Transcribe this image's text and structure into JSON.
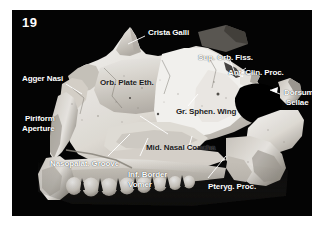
{
  "figure": {
    "number": "19",
    "caption_style": "anatomical photograph plate",
    "background_color": "#ffffff",
    "plate_color": "#050505",
    "label_color": "#ffffff",
    "dark_label_color": "#1a1a1a"
  },
  "labels": [
    {
      "id": "crista-galli",
      "text": "Crista Galli",
      "tone": "light"
    },
    {
      "id": "sup-orb-fiss",
      "text": "Sup. Orb. Fiss.",
      "tone": "light"
    },
    {
      "id": "ant-clin-proc",
      "text": "Ant. Clin. Proc.",
      "tone": "light"
    },
    {
      "id": "dorsum-sellae-1",
      "text": "Dorsum",
      "tone": "light"
    },
    {
      "id": "dorsum-sellae-2",
      "text": "Sellae",
      "tone": "light"
    },
    {
      "id": "agger-nasi",
      "text": "Agger Nasi",
      "tone": "light"
    },
    {
      "id": "orb-plate-eth",
      "text": "Orb. Plate Eth.",
      "tone": "dark"
    },
    {
      "id": "piriform-1",
      "text": "Piriform",
      "tone": "light"
    },
    {
      "id": "piriform-2",
      "text": "Aperture",
      "tone": "light"
    },
    {
      "id": "gr-sphen-wing",
      "text": "Gr. Sphen. Wing",
      "tone": "dark"
    },
    {
      "id": "mid-nasal-concha",
      "text": "Mid. Nasal Concha",
      "tone": "dark"
    },
    {
      "id": "nasopalat-groove",
      "text": "Nasopalat. Groove",
      "tone": "light"
    },
    {
      "id": "inf-border",
      "text": "Inf. Border",
      "tone": "light"
    },
    {
      "id": "vomer",
      "text": "Vomer",
      "tone": "light"
    },
    {
      "id": "pteryg-proc",
      "text": "Pteryg. Proc.",
      "tone": "light"
    }
  ],
  "structures": {
    "crista_galli": "Crista Galli",
    "sup_orb_fiss": "Sup. Orb. Fiss.",
    "ant_clin_proc": "Ant. Clin. Proc.",
    "dorsum_sellae": "Dorsum Sellae",
    "agger_nasi": "Agger Nasi",
    "orb_plate_eth": "Orb. Plate Eth.",
    "piriform_aperture": "Piriform Aperture",
    "gr_sphen_wing": "Gr. Sphen. Wing",
    "mid_nasal_concha": "Mid. Nasal Concha",
    "nasopalat_groove": "Nasopalat. Groove",
    "inf_border_vomer": "Inf. Border Vomer",
    "pteryg_proc": "Pteryg. Proc."
  }
}
